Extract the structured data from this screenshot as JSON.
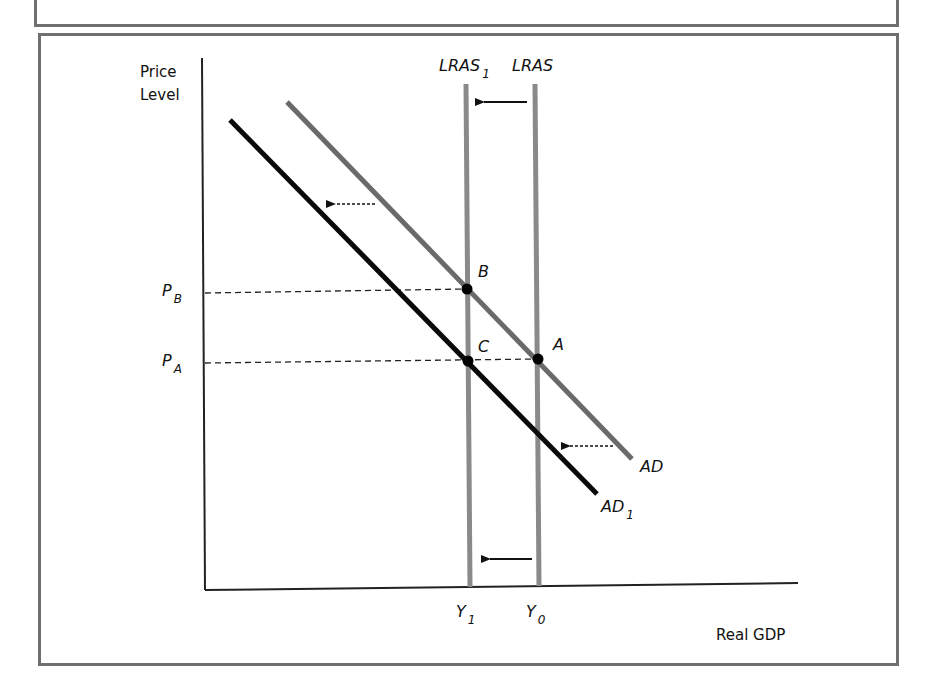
{
  "diagram": {
    "type": "economics-ad-lras",
    "axes": {
      "y_label_line1": "Price",
      "y_label_line2": "Level",
      "x_label": "Real GDP"
    },
    "curves": {
      "lras1": {
        "name": "LRAS",
        "subscript": "1"
      },
      "lras": {
        "name": "LRAS"
      },
      "ad": {
        "name": "AD"
      },
      "ad1": {
        "name": "AD",
        "subscript": "1"
      }
    },
    "points": {
      "a": "A",
      "b": "B",
      "c": "C"
    },
    "price_ticks": {
      "pb": {
        "main": "P",
        "sub": "B"
      },
      "pa": {
        "main": "P",
        "sub": "A"
      }
    },
    "output_ticks": {
      "y1": {
        "main": "Y",
        "sub": "1"
      },
      "y0": {
        "main": "Y",
        "sub": "0"
      }
    },
    "colors": {
      "ad": "#6a6a6a",
      "ad1": "#0a0a0a",
      "lras": "#8a8a8a",
      "frame": "#6f6f6f"
    }
  }
}
